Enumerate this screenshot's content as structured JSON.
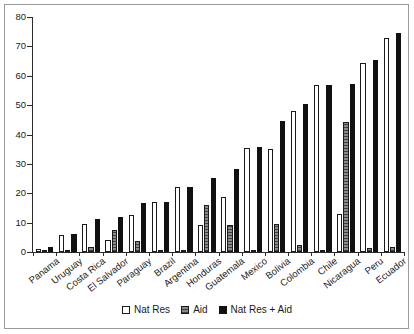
{
  "chart_data": {
    "type": "bar",
    "title": "",
    "subtitle": "",
    "xlabel": "",
    "ylabel": "",
    "ylim": [
      0,
      80
    ],
    "yticks": [
      0,
      10,
      20,
      30,
      40,
      50,
      60,
      70,
      80
    ],
    "grid": false,
    "legend_position": "bottom",
    "categories": [
      "Panama",
      "Uruguay",
      "Costa Rica",
      "El Salvador",
      "Paraguay",
      "Brazil",
      "Argentina",
      "Honduras",
      "Guatemala",
      "Mexico",
      "Bolivia",
      "Colombia",
      "Chile",
      "Nicaragua",
      "Peru",
      "Ecuador"
    ],
    "series": [
      {
        "name": "Nat Res",
        "color": "#ffffff",
        "values": [
          1.0,
          5.8,
          9.6,
          4.2,
          12.7,
          16.9,
          22.0,
          9.2,
          18.8,
          35.3,
          35.2,
          48.1,
          56.7,
          13.1,
          64.2,
          72.8
        ]
      },
      {
        "name": "Aid",
        "color": "#8a8a8a",
        "values": [
          0.3,
          0.3,
          1.6,
          7.6,
          3.9,
          0.2,
          0.2,
          16.0,
          9.2,
          0.2,
          9.4,
          2.3,
          0.2,
          44.2,
          1.2,
          1.7
        ]
      },
      {
        "name": "Nat Res + Aid",
        "color": "#111111",
        "values": [
          1.7,
          6.2,
          11.3,
          11.9,
          16.8,
          17.0,
          22.2,
          25.3,
          28.1,
          35.6,
          44.7,
          50.4,
          57.0,
          57.3,
          65.5,
          74.4
        ]
      }
    ]
  },
  "legend": {
    "items": [
      {
        "label": "Nat Res"
      },
      {
        "label": "Aid"
      },
      {
        "label": "Nat Res + Aid"
      }
    ]
  }
}
